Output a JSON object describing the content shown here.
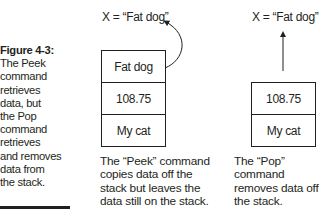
{
  "figure": {
    "title": "Figure 4-3:",
    "caption_lines": [
      "The Peek",
      "command",
      "retrieves",
      "data, but",
      "the Pop",
      "command",
      "retrieves",
      "and removes",
      "data from",
      "the stack."
    ]
  },
  "peek": {
    "result_label": "X = “Fat dog”",
    "stack": [
      "Fat dog",
      "108.75",
      "My cat"
    ],
    "description_lines": [
      "The “Peek” command",
      "copies data off the",
      "stack but leaves the",
      "data still on the stack."
    ]
  },
  "pop": {
    "result_label": "X = “Fat dog”",
    "stack": [
      "108.75",
      "My cat"
    ],
    "description_lines": [
      "The “Pop” command",
      "removes data off",
      "the stack."
    ]
  },
  "colors": {
    "ink": "#231f20",
    "background": "#ffffff"
  }
}
